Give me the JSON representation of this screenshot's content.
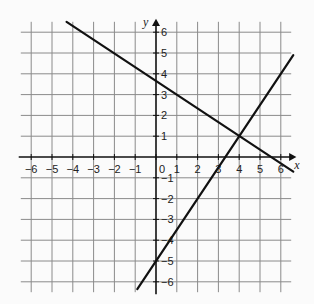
{
  "chart_data": {
    "type": "line",
    "title": "",
    "xlabel": "x",
    "ylabel": "y",
    "xlim": [
      -6,
      6
    ],
    "ylim": [
      -6,
      6
    ],
    "grid": true,
    "x_ticks": [
      -6,
      -5,
      -4,
      -3,
      -2,
      -1,
      0,
      1,
      2,
      3,
      4,
      5,
      6
    ],
    "y_ticks": [
      -6,
      -5,
      -4,
      -3,
      -2,
      -1,
      1,
      2,
      3,
      4,
      5,
      6
    ],
    "series": [
      {
        "name": "line-decreasing",
        "equation": "y = -2/3 x + 11/3",
        "points": [
          [
            -4.3,
            6.5
          ],
          [
            0,
            3.67
          ],
          [
            4,
            1
          ],
          [
            6.6,
            -0.7
          ]
        ]
      },
      {
        "name": "line-increasing",
        "equation": "y = 1.5 x - 5",
        "points": [
          [
            -0.9,
            -6.35
          ],
          [
            0,
            -5
          ],
          [
            4,
            1
          ],
          [
            6.6,
            4.9
          ]
        ]
      }
    ],
    "intersection": [
      4,
      1
    ]
  },
  "layout": {
    "origin_px": [
      156,
      157
    ],
    "unit_px": 20.8,
    "grid_cols": [
      -6.5,
      6.5
    ],
    "line_color": "#111111",
    "grid_color": "#8a8a8a"
  }
}
